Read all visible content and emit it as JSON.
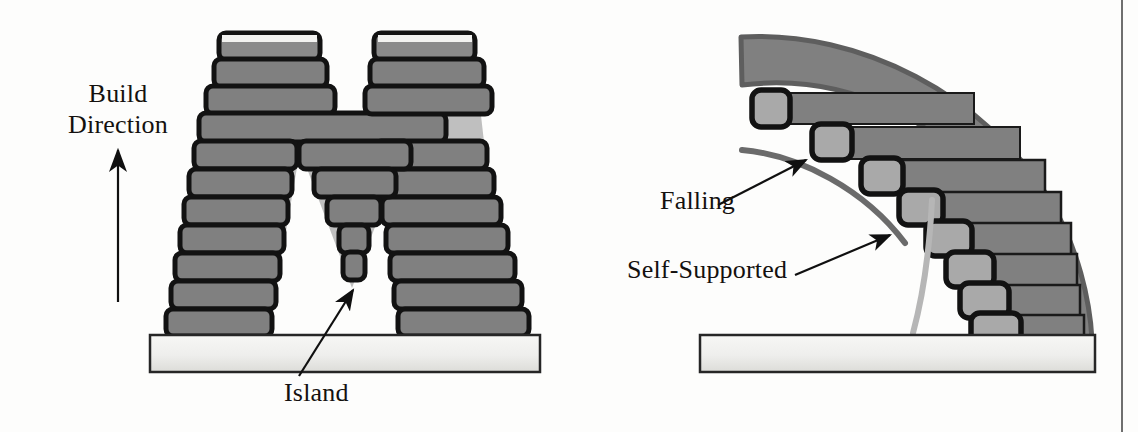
{
  "figure": {
    "kind": "technical-diagram",
    "topic": "Additive manufacturing build-direction overhang illustration",
    "panels": [
      {
        "id": "left-panel",
        "caption_labels": [
          "Build Direction",
          "Island"
        ],
        "description": "Letter M built in stacked layers on a base plate, with an inverted-V island feature"
      },
      {
        "id": "right-panel",
        "caption_labels": [
          "Falling",
          "Self-Supported"
        ],
        "description": "Curved arc part approximated by staircase layers on a base plate"
      }
    ]
  },
  "labels": {
    "build_direction": "Build\nDirection",
    "build_direction_line1": "Build",
    "build_direction_line2": "Direction",
    "island": "Island",
    "falling": "Falling",
    "self_supported": "Self-Supported"
  },
  "colors": {
    "block_fill": "#808080",
    "block_fill_dark": "#757575",
    "block_fill_light": "#a9a9a9",
    "block_outline": "#121212",
    "ghost_band": "#7e7e7e",
    "ghost_band_edge": "#5e5e5e",
    "baseplate_top": "#f4f4f2",
    "baseplate_bottom": "#d9d9d6",
    "baseplate_outline": "#262626",
    "arc_falling": "#6b6b6b",
    "arc_self_supported": "#b6b6b6",
    "text": "#14110f",
    "arrow": "#101010",
    "page_edge": "#6f6f6f",
    "background": "#fdfdfc"
  },
  "left_panel": {
    "baseplate": {
      "x": 150,
      "y": 335,
      "w": 390,
      "h": 37
    },
    "build_arrow": {
      "x": 118,
      "y_tail": 300,
      "y_head": 145
    },
    "island_leader": {
      "x1": 300,
      "y1": 374,
      "x2": 352,
      "y2": 287
    },
    "left_leg_blocks": [
      {
        "x": 219,
        "y": 33,
        "w": 101,
        "h": 27
      },
      {
        "x": 214,
        "y": 60,
        "w": 113,
        "h": 27
      },
      {
        "x": 207,
        "y": 87,
        "w": 128,
        "h": 27
      },
      {
        "x": 200,
        "y": 114,
        "w": 245,
        "h": 28
      },
      {
        "x": 195,
        "y": 142,
        "w": 102,
        "h": 28
      },
      {
        "x": 190,
        "y": 170,
        "w": 102,
        "h": 28
      },
      {
        "x": 185,
        "y": 198,
        "w": 103,
        "h": 28
      },
      {
        "x": 181,
        "y": 226,
        "w": 103,
        "h": 28
      },
      {
        "x": 176,
        "y": 254,
        "w": 104,
        "h": 28
      },
      {
        "x": 172,
        "y": 282,
        "w": 104,
        "h": 28
      },
      {
        "x": 167,
        "y": 310,
        "w": 105,
        "h": 26
      }
    ],
    "right_leg_blocks": [
      {
        "x": 375,
        "y": 33,
        "w": 101,
        "h": 27
      },
      {
        "x": 375,
        "y": 60,
        "w": 110,
        "h": 27
      },
      {
        "x": 375,
        "y": 87,
        "w": 118,
        "h": 27
      },
      {
        "x": 375,
        "y": 142,
        "w": 110,
        "h": 28
      },
      {
        "x": 375,
        "y": 170,
        "w": 114,
        "h": 28
      },
      {
        "x": 375,
        "y": 198,
        "w": 118,
        "h": 28
      },
      {
        "x": 375,
        "y": 226,
        "w": 122,
        "h": 28
      },
      {
        "x": 375,
        "y": 254,
        "w": 126,
        "h": 28
      },
      {
        "x": 375,
        "y": 282,
        "w": 130,
        "h": 28
      },
      {
        "x": 375,
        "y": 310,
        "w": 134,
        "h": 26
      }
    ],
    "island_blocks": [
      {
        "x": 300,
        "y": 142,
        "w": 110,
        "h": 28
      },
      {
        "x": 315,
        "y": 170,
        "w": 80,
        "h": 28
      },
      {
        "x": 328,
        "y": 198,
        "w": 52,
        "h": 28
      },
      {
        "x": 340,
        "y": 226,
        "w": 28,
        "h": 28
      },
      {
        "x": 344,
        "y": 254,
        "w": 20,
        "h": 26
      }
    ]
  },
  "right_panel": {
    "baseplate": {
      "x": 700,
      "y": 335,
      "w": 395,
      "h": 37
    },
    "arc": {
      "cx": 1060,
      "cy": 340,
      "r_inner": 228,
      "r_outer": 284
    },
    "falling_arc": {
      "r": 200,
      "a_start": 178,
      "a_end": 232
    },
    "self_supported_arc": {
      "r": 182,
      "a_start": 183,
      "a_end": 268
    },
    "falling_arrow": {
      "x1": 715,
      "y1": 200,
      "x2": 800,
      "y2": 158
    },
    "self_supported_arrow": {
      "x1": 790,
      "y1": 272,
      "x2": 880,
      "y2": 230
    },
    "stair_layers": [
      {
        "light": {
          "x": 752,
          "y": 90,
          "w": 36,
          "h": 36
        },
        "dark": {
          "x": 788,
          "y": 93,
          "w": 186,
          "h": 30
        }
      },
      {
        "light": {
          "x": 812,
          "y": 125,
          "w": 38,
          "h": 34
        },
        "dark": {
          "x": 850,
          "y": 127,
          "w": 170,
          "h": 32
        }
      },
      {
        "light": {
          "x": 862,
          "y": 159,
          "w": 40,
          "h": 34
        },
        "dark": {
          "x": 902,
          "y": 161,
          "w": 142,
          "h": 32
        }
      },
      {
        "light": {
          "x": 900,
          "y": 191,
          "w": 42,
          "h": 33
        },
        "dark": {
          "x": 942,
          "y": 193,
          "w": 118,
          "h": 32
        }
      },
      {
        "light": {
          "x": 928,
          "y": 222,
          "w": 44,
          "h": 33
        },
        "dark": {
          "x": 972,
          "y": 224,
          "w": 98,
          "h": 32
        }
      },
      {
        "light": {
          "x": 948,
          "y": 253,
          "w": 46,
          "h": 33
        },
        "dark": {
          "x": 994,
          "y": 255,
          "w": 82,
          "h": 32
        }
      },
      {
        "light": {
          "x": 962,
          "y": 284,
          "w": 48,
          "h": 32
        },
        "dark": {
          "x": 1010,
          "y": 286,
          "w": 70,
          "h": 32
        }
      },
      {
        "light": {
          "x": 972,
          "y": 314,
          "w": 50,
          "h": 33
        },
        "dark": {
          "x": 1022,
          "y": 316,
          "w": 62,
          "h": 33
        }
      }
    ]
  }
}
